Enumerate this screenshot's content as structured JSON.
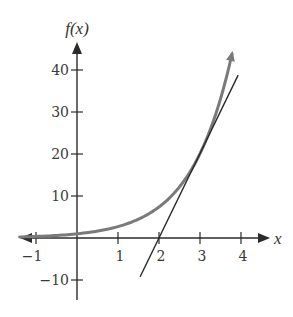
{
  "chart_data": {
    "type": "line",
    "title": "",
    "xlabel": "x",
    "ylabel": "f(x)",
    "xlim": [
      -1.4,
      4.7
    ],
    "ylim": [
      -12,
      47
    ],
    "grid": false,
    "legend": null,
    "x_ticks": [
      -1,
      1,
      2,
      3,
      4
    ],
    "x_tick_labels": [
      "−1",
      "1",
      "2",
      "3",
      "4"
    ],
    "y_ticks": [
      -10,
      10,
      20,
      30,
      40
    ],
    "y_tick_labels": [
      "−10",
      "10",
      "20",
      "30",
      "40"
    ],
    "series": [
      {
        "name": "f(x) = e^x",
        "kind": "curve",
        "color": "#7a7a7a",
        "width": 3,
        "arrow_end": true,
        "x": [
          -1.4,
          -1,
          -0.5,
          0,
          0.5,
          1,
          1.5,
          2,
          2.5,
          3,
          3.25,
          3.5,
          3.65,
          3.78
        ],
        "values": [
          0.25,
          0.37,
          0.61,
          1.0,
          1.65,
          2.72,
          4.48,
          7.39,
          12.18,
          20.09,
          25.79,
          33.12,
          38.47,
          43.82
        ]
      },
      {
        "name": "tangent line at x = 3",
        "kind": "line",
        "color": "#2a2a2a",
        "width": 1.4,
        "x": [
          1.54,
          3.93
        ],
        "values": [
          -9.24,
          38.77
        ]
      }
    ],
    "annotations": []
  },
  "axes": {
    "x_label": "x",
    "y_label": "f(x)"
  }
}
